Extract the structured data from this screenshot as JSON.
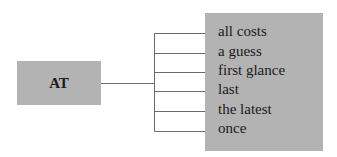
{
  "diagram": {
    "root": {
      "label": "AT"
    },
    "branches": [
      {
        "label": "all costs"
      },
      {
        "label": "a guess"
      },
      {
        "label": "first glance"
      },
      {
        "label": "last"
      },
      {
        "label": "the latest"
      },
      {
        "label": "once"
      }
    ],
    "colors": {
      "box_fill": "#b3b3b3",
      "line": "#6a6a6a",
      "text": "#1a1a1a"
    }
  }
}
